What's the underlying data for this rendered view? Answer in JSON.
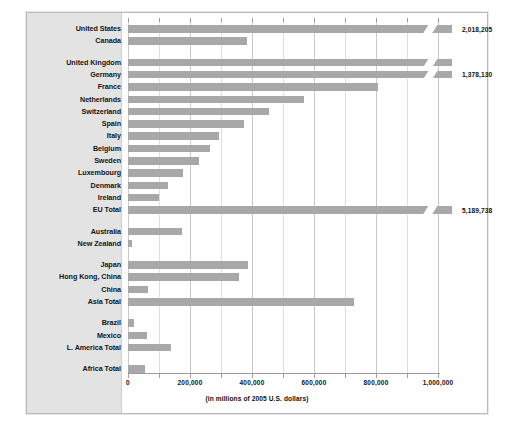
{
  "chart_data": {
    "type": "bar",
    "orientation": "horizontal",
    "title": "",
    "xlabel": "(in millions of 2005 U.S. dollars)",
    "ylabel": "",
    "xlim": [
      0,
      1000000
    ],
    "xticks": [
      0,
      200000,
      400000,
      600000,
      800000,
      1000000
    ],
    "xtick_labels": [
      "0",
      "200,000",
      "400,000",
      "600,000",
      "800,000",
      "1,000,000"
    ],
    "minor_tick_interval": 100000,
    "grid": true,
    "legend": "none",
    "bar_color": "#a8a8a8",
    "note": "Bars exceeding the axis maximum are drawn with an axis-break slash and labeled with their true value.",
    "categories": [
      "United States",
      "Canada",
      "United Kingdom",
      "Germany",
      "France",
      "Netherlands",
      "Switzerland",
      "Spain",
      "Italy",
      "Belgium",
      "Sweden",
      "Luxembourg",
      "Denmark",
      "Ireland",
      "EU Total",
      "Australia",
      "New Zealand",
      "Japan",
      "Hong Kong, China",
      "China",
      "Asia Total",
      "Brazil",
      "Mexico",
      "L. America Total",
      "Africa Total"
    ],
    "values": [
      2018205,
      385000,
      2018205,
      1378130,
      805000,
      568000,
      455000,
      375000,
      293000,
      263000,
      230000,
      178000,
      128000,
      100000,
      5189738,
      175000,
      12000,
      386000,
      358000,
      63000,
      730000,
      18000,
      62000,
      140000,
      55000
    ],
    "bars": [
      {
        "label": "United States",
        "value": 2018205,
        "pixel_value": 1000000,
        "broken": true,
        "value_label": "2,018,205"
      },
      {
        "label": "Canada",
        "value": 385000,
        "pixel_value": 385000,
        "broken": false,
        "value_label": ""
      },
      {
        "label": "United Kingdom",
        "value": 2018205,
        "pixel_value": 1000000,
        "broken": true,
        "value_label": ""
      },
      {
        "label": "Germany",
        "value": 1378130,
        "pixel_value": 1000000,
        "broken": true,
        "value_label": "1,378,130"
      },
      {
        "label": "France",
        "value": 805000,
        "pixel_value": 805000,
        "broken": false,
        "value_label": ""
      },
      {
        "label": "Netherlands",
        "value": 568000,
        "pixel_value": 568000,
        "broken": false,
        "value_label": ""
      },
      {
        "label": "Switzerland",
        "value": 455000,
        "pixel_value": 455000,
        "broken": false,
        "value_label": ""
      },
      {
        "label": "Spain",
        "value": 375000,
        "pixel_value": 375000,
        "broken": false,
        "value_label": ""
      },
      {
        "label": "Italy",
        "value": 293000,
        "pixel_value": 293000,
        "broken": false,
        "value_label": ""
      },
      {
        "label": "Belgium",
        "value": 263000,
        "pixel_value": 263000,
        "broken": false,
        "value_label": ""
      },
      {
        "label": "Sweden",
        "value": 230000,
        "pixel_value": 230000,
        "broken": false,
        "value_label": ""
      },
      {
        "label": "Luxembourg",
        "value": 178000,
        "pixel_value": 178000,
        "broken": false,
        "value_label": ""
      },
      {
        "label": "Denmark",
        "value": 128000,
        "pixel_value": 128000,
        "broken": false,
        "value_label": ""
      },
      {
        "label": "Ireland",
        "value": 100000,
        "pixel_value": 100000,
        "broken": false,
        "value_label": ""
      },
      {
        "label": "EU Total",
        "value": 5189738,
        "pixel_value": 1000000,
        "broken": true,
        "value_label": "5,189,738"
      },
      {
        "label": "Australia",
        "value": 175000,
        "pixel_value": 175000,
        "broken": false,
        "value_label": ""
      },
      {
        "label": "New Zealand",
        "value": 12000,
        "pixel_value": 12000,
        "broken": false,
        "value_label": ""
      },
      {
        "label": "Japan",
        "value": 386000,
        "pixel_value": 386000,
        "broken": false,
        "value_label": ""
      },
      {
        "label": "Hong Kong, China",
        "value": 358000,
        "pixel_value": 358000,
        "broken": false,
        "value_label": ""
      },
      {
        "label": "China",
        "value": 63000,
        "pixel_value": 63000,
        "broken": false,
        "value_label": ""
      },
      {
        "label": "Asia Total",
        "value": 730000,
        "pixel_value": 730000,
        "broken": false,
        "value_label": ""
      },
      {
        "label": "Brazil",
        "value": 18000,
        "pixel_value": 18000,
        "broken": false,
        "value_label": ""
      },
      {
        "label": "Mexico",
        "value": 62000,
        "pixel_value": 62000,
        "broken": false,
        "value_label": ""
      },
      {
        "label": "L. America Total",
        "value": 140000,
        "pixel_value": 140000,
        "broken": false,
        "value_label": ""
      },
      {
        "label": "Africa Total",
        "value": 55000,
        "pixel_value": 55000,
        "broken": false,
        "value_label": ""
      }
    ],
    "group_breaks_after": [
      "Canada",
      "EU Total",
      "New Zealand",
      "Asia Total",
      "L. America Total"
    ]
  }
}
